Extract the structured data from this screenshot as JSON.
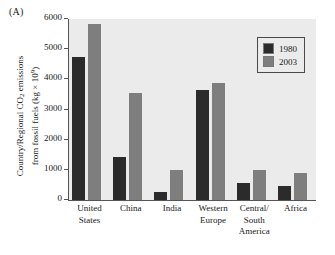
{
  "panel": {
    "label": "(A)"
  },
  "axis_title": {
    "line1_pre": "Country/Regional CO",
    "line1_sub": "2",
    "line1_post": " emissions",
    "line2_pre": "from fossil fuels (kg × 10",
    "line2_sup": "9",
    "line2_post": ")"
  },
  "legend": {
    "position": "top-right",
    "entries": [
      {
        "label": "1980",
        "color": "#2b2b2b"
      },
      {
        "label": "2003",
        "color": "#7e7e7e"
      }
    ]
  },
  "chart_data": {
    "type": "bar",
    "title": "(A)",
    "xlabel": "",
    "ylabel": "Country/Regional CO2 emissions from fossil fuels (kg × 10^9)",
    "ylim": [
      0,
      6000
    ],
    "yticks": [
      0,
      1000,
      2000,
      3000,
      4000,
      5000,
      6000
    ],
    "ytick_labels": [
      "0",
      "1000",
      "2000",
      "3000",
      "4000",
      "5000",
      "6000"
    ],
    "grid": false,
    "legend_position": "top-right",
    "categories": [
      [
        "United",
        "States"
      ],
      [
        "China"
      ],
      [
        "India"
      ],
      [
        "Western",
        "Europe"
      ],
      [
        "Central/",
        "South",
        "America"
      ],
      [
        "Africa"
      ]
    ],
    "category_labels": [
      "United States",
      "China",
      "India",
      "Western Europe",
      "Central/South America",
      "Africa"
    ],
    "series": [
      {
        "name": "1980",
        "color": "#2b2b2b",
        "values": [
          4750,
          1420,
          270,
          3650,
          580,
          460
        ]
      },
      {
        "name": "2003",
        "color": "#7e7e7e",
        "values": [
          5820,
          3550,
          1000,
          3880,
          1000,
          900
        ]
      }
    ]
  }
}
